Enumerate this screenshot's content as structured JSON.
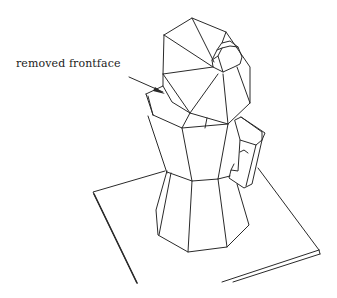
{
  "figure": {
    "annotation": {
      "text": "removed frontface",
      "arrow_target": "removed front face of lid"
    },
    "colors": {
      "line": "#2a2a2a",
      "background": "#ffffff"
    }
  }
}
